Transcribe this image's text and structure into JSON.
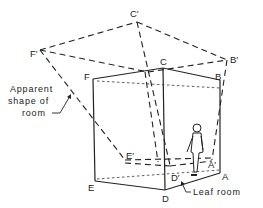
{
  "figure": {
    "labels": {
      "A": "A",
      "B": "B",
      "C": "C",
      "D": "D",
      "E": "E",
      "F": "F",
      "A_prime": "A′",
      "B_prime": "B′",
      "C_prime": "C′",
      "D_prime": "D′",
      "E_prime": "E′",
      "F_prime": "F′"
    },
    "annotations": {
      "apparent_line1": "Apparent",
      "apparent_line2": "shape of",
      "apparent_line3": "room",
      "leaf_room": "Leaf room"
    }
  }
}
